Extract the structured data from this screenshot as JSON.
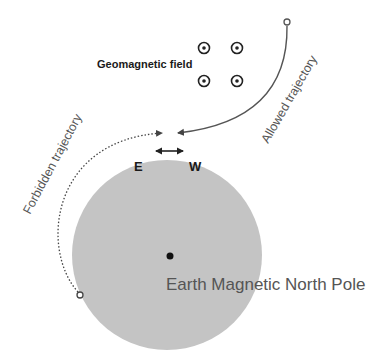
{
  "diagram": {
    "title": "",
    "labels": {
      "geomagnetic_field": "Geomagnetic field",
      "allowed_trajectory": "Allowed trajectory",
      "forbidden_trajectory": "Forbidden trajectory",
      "east": "E",
      "west": "W",
      "pole": "Earth Magnetic North Pole"
    },
    "colors": {
      "earth": "#c4c4c4",
      "trajectory": "#555555",
      "text": "#1a1a1a",
      "pole_label": "#555555",
      "background": "#ffffff"
    },
    "field_symbol": "dot-in-circle (field out of page)",
    "field_symbol_count": 4
  }
}
